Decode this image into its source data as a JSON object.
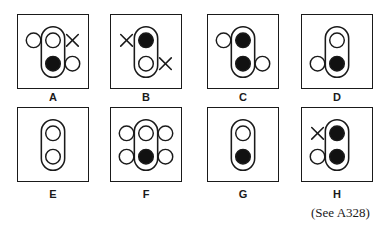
{
  "figure": {
    "caption": "(See A328)",
    "colors": {
      "stroke": "#1a1a1a",
      "filled": "#111111",
      "background": "#ffffff"
    },
    "panels": [
      {
        "label": "A",
        "pill": {
          "top": "empty",
          "bottom": "filled"
        },
        "side_markers": [
          {
            "position": "left-top",
            "type": "circle"
          },
          {
            "position": "right-top",
            "type": "cross"
          },
          {
            "position": "right-bottom",
            "type": "circle"
          }
        ]
      },
      {
        "label": "B",
        "pill": {
          "top": "filled",
          "bottom": "empty"
        },
        "side_markers": [
          {
            "position": "left-top",
            "type": "cross"
          },
          {
            "position": "right-bottom",
            "type": "cross"
          }
        ]
      },
      {
        "label": "C",
        "pill": {
          "top": "filled",
          "bottom": "filled"
        },
        "side_markers": [
          {
            "position": "left-top",
            "type": "circle"
          },
          {
            "position": "right-bottom",
            "type": "circle"
          }
        ]
      },
      {
        "label": "D",
        "pill": {
          "top": "empty",
          "bottom": "filled"
        },
        "side_markers": [
          {
            "position": "left-bottom",
            "type": "circle"
          }
        ]
      },
      {
        "label": "E",
        "pill": {
          "top": "empty",
          "bottom": "empty"
        },
        "side_markers": []
      },
      {
        "label": "F",
        "pill": {
          "top": "empty",
          "bottom": "filled"
        },
        "side_markers": [
          {
            "position": "left-top",
            "type": "circle"
          },
          {
            "position": "left-bottom",
            "type": "circle"
          },
          {
            "position": "right-top",
            "type": "circle"
          },
          {
            "position": "right-bottom",
            "type": "circle"
          }
        ]
      },
      {
        "label": "G",
        "pill": {
          "top": "empty",
          "bottom": "filled"
        },
        "side_markers": []
      },
      {
        "label": "H",
        "pill": {
          "top": "filled",
          "bottom": "filled"
        },
        "side_markers": [
          {
            "position": "left-top",
            "type": "cross"
          },
          {
            "position": "left-bottom",
            "type": "circle"
          }
        ]
      }
    ]
  }
}
